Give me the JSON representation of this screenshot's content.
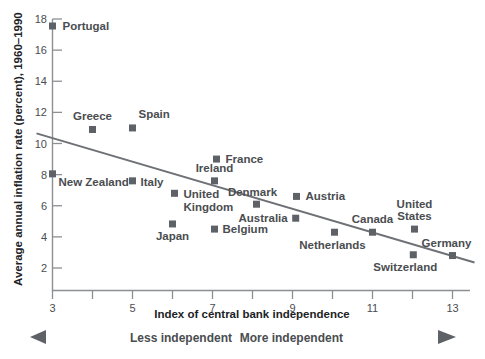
{
  "chart_data": {
    "type": "scatter",
    "title": "",
    "xlabel": "Index of central bank independence",
    "ylabel": "Average annual inflation rate (percent), 1960–1990",
    "xlim": [
      2.6,
      13.6
    ],
    "ylim": [
      1.2,
      18.4
    ],
    "xticks": [
      3,
      4,
      5,
      6,
      7,
      8,
      9,
      10,
      11,
      12,
      13
    ],
    "xtick_labels": [
      "3",
      "",
      "5",
      "",
      "7",
      "",
      "9",
      "",
      "11",
      "",
      "13"
    ],
    "yticks": [
      2,
      4,
      6,
      8,
      10,
      12,
      14,
      16,
      18
    ],
    "ytick_labels": [
      "2",
      "4",
      "6",
      "8",
      "10",
      "12",
      "14",
      "16",
      "18"
    ],
    "grid": false,
    "legend": "none",
    "marker_color": "#5e6266",
    "trendline_color": "#6e7175",
    "axis_color": "#8d8f92",
    "trendline": {
      "x0": 2.6,
      "y0": 10.65,
      "x1": 13.55,
      "y1": 2.35
    },
    "points": [
      {
        "label": "Portugal",
        "x": 3.0,
        "y": 17.55,
        "label_dx": 10,
        "label_dy": 4,
        "anchor": "start"
      },
      {
        "label": "Greece",
        "x": 4.0,
        "y": 10.9,
        "label_dx": 0,
        "label_dy": -9,
        "anchor": "middle"
      },
      {
        "label": "Spain",
        "x": 5.0,
        "y": 11.0,
        "label_dx": 6,
        "label_dy": -10,
        "anchor": "start"
      },
      {
        "label": "New Zealand",
        "x": 3.0,
        "y": 8.05,
        "label_dx": 6,
        "label_dy": 12,
        "anchor": "start"
      },
      {
        "label": "Italy",
        "x": 5.0,
        "y": 7.6,
        "label_dx": 8,
        "label_dy": 5,
        "anchor": "start"
      },
      {
        "label": "France",
        "x": 7.1,
        "y": 9.0,
        "label_dx": 9,
        "label_dy": 4,
        "anchor": "start"
      },
      {
        "label": "Ireland",
        "x": 7.05,
        "y": 7.6,
        "label_dx": 0,
        "label_dy": -9,
        "anchor": "middle"
      },
      {
        "label": "United",
        "x": 6.05,
        "y": 6.8,
        "label_dx": 9,
        "label_dy": 5,
        "anchor": "start"
      },
      {
        "label": "Kingdom",
        "x": 6.05,
        "y": 6.8,
        "label_dx": 9,
        "label_dy": 18,
        "anchor": "start",
        "text_only": true
      },
      {
        "label": "Denmark",
        "x": 8.1,
        "y": 6.1,
        "label_dx": -4,
        "label_dy": -8,
        "anchor": "middle"
      },
      {
        "label": "Austria",
        "x": 9.1,
        "y": 6.6,
        "label_dx": 9,
        "label_dy": 4,
        "anchor": "start"
      },
      {
        "label": "Australia",
        "x": 9.08,
        "y": 5.2,
        "label_dx": -8,
        "label_dy": 4,
        "anchor": "end"
      },
      {
        "label": "Japan",
        "x": 6.0,
        "y": 4.83,
        "label_dx": 0,
        "label_dy": 16,
        "anchor": "middle"
      },
      {
        "label": "Belgium",
        "x": 7.05,
        "y": 4.5,
        "label_dx": 8,
        "label_dy": 4,
        "anchor": "start"
      },
      {
        "label": "Netherlands",
        "x": 10.05,
        "y": 4.3,
        "label_dx": -2,
        "label_dy": 17,
        "anchor": "middle"
      },
      {
        "label": "Canada",
        "x": 11.0,
        "y": 4.3,
        "label_dx": 0,
        "label_dy": -9,
        "anchor": "middle"
      },
      {
        "label": "United",
        "x": 12.05,
        "y": 4.5,
        "label_dx": 0,
        "label_dy": -21,
        "anchor": "middle"
      },
      {
        "label": "States",
        "x": 12.05,
        "y": 4.5,
        "label_dx": 0,
        "label_dy": -9,
        "anchor": "middle",
        "text_only": true
      },
      {
        "label": "Switzerland",
        "x": 12.02,
        "y": 2.85,
        "label_dx": -8,
        "label_dy": 16,
        "anchor": "middle"
      },
      {
        "label": "Germany",
        "x": 13.0,
        "y": 2.8,
        "label_dx": -6,
        "label_dy": -9,
        "anchor": "middle"
      }
    ],
    "annotations": {
      "left_arrow_label": "Less independent",
      "right_arrow_label": "More independent"
    }
  }
}
